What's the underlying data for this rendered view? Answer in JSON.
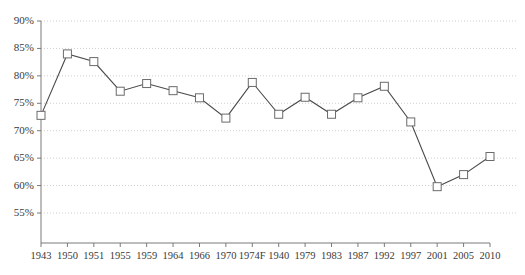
{
  "chart_data": {
    "type": "line",
    "title": "",
    "subtitle": "",
    "xlabel": "",
    "ylabel": "",
    "categories": [
      "1943",
      "1950",
      "1951",
      "1955",
      "1959",
      "1964",
      "1966",
      "1970",
      "1974F",
      "1940",
      "1979",
      "1983",
      "1987",
      "1992",
      "1997",
      "2001",
      "2005",
      "2010"
    ],
    "values": [
      72.8,
      84.0,
      82.6,
      77.2,
      78.6,
      77.3,
      76.0,
      72.3,
      78.8,
      73.0,
      76.1,
      73.0,
      76.0,
      78.1,
      71.6,
      59.8,
      62.0,
      65.3
    ],
    "series": [
      {
        "name": "",
        "values": [
          72.8,
          84.0,
          82.6,
          77.2,
          78.6,
          77.3,
          76.0,
          72.3,
          78.8,
          73.0,
          76.1,
          73.0,
          76.0,
          78.1,
          71.6,
          59.8,
          62.0,
          65.3
        ]
      }
    ],
    "ylim": [
      52.5,
      90
    ],
    "yticks": [
      55,
      60,
      65,
      70,
      75,
      80,
      85,
      90
    ],
    "ytick_labels": [
      "55%",
      "60%",
      "65%",
      "70%",
      "75%",
      "80%",
      "85%",
      "90%"
    ],
    "grid": true,
    "grid_axis": "y",
    "grid_style": "dotted",
    "legend": false,
    "legend_position": "none",
    "marker": "square",
    "marker_facecolor": "#ffffff",
    "marker_edgecolor": "#6b6b6b",
    "line_color": "#4a4a4a",
    "grid_color": "#cfcfcf",
    "axis_color": "#7a7a7a",
    "text_color": "#3a3a3a",
    "background": "#ffffff"
  }
}
